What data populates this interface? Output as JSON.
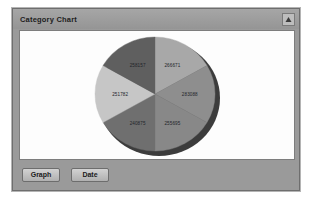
{
  "panel": {
    "title": "Category Chart",
    "collapse_icon": "collapse-up-arrow-icon"
  },
  "buttons": [
    {
      "label": "Graph",
      "name": "graph-button"
    },
    {
      "label": "Date",
      "name": "date-button"
    }
  ],
  "colors": {
    "panel_background": "#9a9a9a",
    "panel_border": "#6e6e6e",
    "chart_background": "#fdfdfd",
    "label_text": "#22242a",
    "shadow": "#1a1a1a"
  },
  "chart_data": {
    "type": "pie",
    "title": "Category Chart",
    "legend": "none",
    "labels_shown": true,
    "slices": [
      {
        "label": "266671",
        "value": 266671,
        "color": "#a8a8a8",
        "start_angle": -90,
        "end_angle": -30
      },
      {
        "label": "283088",
        "value": 283088,
        "color": "#8e8e8e",
        "start_angle": -30,
        "end_angle": 30
      },
      {
        "label": "255695",
        "value": 255695,
        "color": "#888888",
        "start_angle": 30,
        "end_angle": 90
      },
      {
        "label": "240875",
        "value": 240875,
        "color": "#6f6f6f",
        "start_angle": 90,
        "end_angle": 150
      },
      {
        "label": "251782",
        "value": 251782,
        "color": "#c6c6c6",
        "start_angle": 150,
        "end_angle": 210
      },
      {
        "label": "258157",
        "value": 258157,
        "color": "#5f5f5f",
        "start_angle": 210,
        "end_angle": 270
      }
    ]
  }
}
